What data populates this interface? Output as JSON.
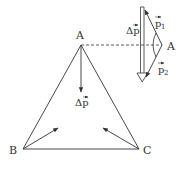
{
  "diagram": {
    "colors": {
      "line": "#333333",
      "background": "#ffffff"
    },
    "triangle": {
      "vertices": [
        {
          "name": "A",
          "x": 81,
          "y": 45
        },
        {
          "name": "B",
          "x": 23,
          "y": 149
        },
        {
          "name": "C",
          "x": 139,
          "y": 149
        }
      ],
      "labels": {
        "A": "A",
        "B": "B",
        "C": "C"
      }
    },
    "vector_at_A": {
      "label": "Δp",
      "from": [
        81,
        45
      ],
      "to": [
        81,
        92
      ]
    },
    "vector_at_B": {
      "from": [
        23,
        149
      ],
      "to": [
        58,
        128
      ]
    },
    "vector_at_C": {
      "from": [
        139,
        149
      ],
      "to": [
        103,
        128
      ]
    },
    "dashed_line": {
      "from": [
        81,
        45
      ],
      "to": [
        162,
        45
      ]
    },
    "vector_triangle": {
      "vertex_label": "A",
      "p1_label": "p",
      "p1_sub": "1",
      "p2_label": "p",
      "p2_sub": "2",
      "delta_label": "Δp"
    }
  }
}
